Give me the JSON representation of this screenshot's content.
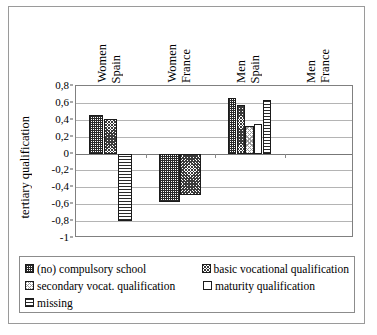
{
  "chart_data": {
    "type": "bar",
    "title": "",
    "xlabel": "",
    "ylabel": "tertiary qualification",
    "ylim": [
      -1,
      0.8
    ],
    "grid": true,
    "legend_position": "bottom",
    "categories": [
      "Women Spain",
      "Women France",
      "Men Spain",
      "Men France"
    ],
    "category_lines": [
      [
        "Women",
        "Spain"
      ],
      [
        "Women",
        "France"
      ],
      [
        "Men",
        "Spain"
      ],
      [
        "Men",
        "France"
      ]
    ],
    "ytick_labels": [
      "0,8",
      "0,6",
      "0,4",
      "0,2",
      "0",
      "-0,2",
      "-0,4",
      "-0,6",
      "-0,8",
      "-1"
    ],
    "ytick_values": [
      0.8,
      0.6,
      0.4,
      0.2,
      0,
      -0.2,
      -0.4,
      -0.6,
      -0.8,
      -1
    ],
    "series": [
      {
        "name": "(no) compulsory school",
        "pattern": "pat-grid",
        "values": [
          0.46,
          -0.57,
          0.66,
          null
        ]
      },
      {
        "name": "basic vocational qualification",
        "pattern": "pat-dark-speckle",
        "values": [
          0.41,
          -0.49,
          0.57,
          null
        ]
      },
      {
        "name": "secondary vocat. qualification",
        "pattern": "pat-light-speckle",
        "values": [
          null,
          null,
          0.33,
          null
        ]
      },
      {
        "name": "maturity qualification",
        "pattern": "pat-white",
        "values": [
          null,
          null,
          0.35,
          null
        ]
      },
      {
        "name": "missing",
        "pattern": "pat-hlines",
        "values": [
          -0.8,
          null,
          0.64,
          null
        ]
      }
    ]
  },
  "legend": {
    "items": [
      {
        "label": "(no) compulsory school",
        "pattern": "pat-grid"
      },
      {
        "label": "basic vocational qualification",
        "pattern": "pat-dark-speckle"
      },
      {
        "label": "secondary vocat. qualification",
        "pattern": "pat-light-speckle"
      },
      {
        "label": "maturity qualification",
        "pattern": "pat-white"
      },
      {
        "label": "missing",
        "pattern": "pat-hlines"
      }
    ]
  },
  "axis": {
    "y_title": "tertiary qualification"
  }
}
